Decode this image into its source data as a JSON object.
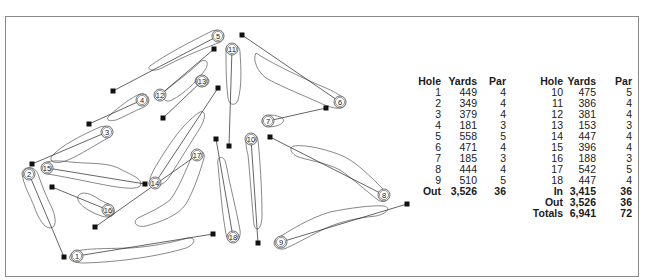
{
  "scorecard": {
    "headers": {
      "hole": "Hole",
      "yards": "Yards",
      "par": "Par"
    },
    "front_nine": [
      {
        "hole": "1",
        "yards": "449",
        "par": "4"
      },
      {
        "hole": "2",
        "yards": "349",
        "par": "4"
      },
      {
        "hole": "3",
        "yards": "379",
        "par": "4"
      },
      {
        "hole": "4",
        "yards": "181",
        "par": "3"
      },
      {
        "hole": "5",
        "yards": "558",
        "par": "5"
      },
      {
        "hole": "6",
        "yards": "471",
        "par": "4"
      },
      {
        "hole": "7",
        "yards": "185",
        "par": "3"
      },
      {
        "hole": "8",
        "yards": "444",
        "par": "4"
      },
      {
        "hole": "9",
        "yards": "510",
        "par": "5"
      }
    ],
    "front_total": {
      "label": "Out",
      "yards": "3,526",
      "par": "36"
    },
    "back_nine": [
      {
        "hole": "10",
        "yards": "475",
        "par": "5"
      },
      {
        "hole": "11",
        "yards": "386",
        "par": "4"
      },
      {
        "hole": "12",
        "yards": "381",
        "par": "4"
      },
      {
        "hole": "13",
        "yards": "153",
        "par": "3"
      },
      {
        "hole": "14",
        "yards": "447",
        "par": "4"
      },
      {
        "hole": "15",
        "yards": "396",
        "par": "4"
      },
      {
        "hole": "16",
        "yards": "188",
        "par": "3"
      },
      {
        "hole": "17",
        "yards": "542",
        "par": "5"
      },
      {
        "hole": "18",
        "yards": "447",
        "par": "4"
      }
    ],
    "back_totals": [
      {
        "label": "In",
        "yards": "3,415",
        "par": "36"
      },
      {
        "label": "Out",
        "yards": "3,526",
        "par": "36"
      },
      {
        "label": "Totals",
        "yards": "6,941",
        "par": "72"
      }
    ]
  },
  "course_map": {
    "holes": [
      {
        "number": "1",
        "green": [
          77,
          256
        ],
        "tee": [
          213,
          234
        ]
      },
      {
        "number": "2",
        "green": [
          29,
          174
        ],
        "tee": [
          64,
          257
        ]
      },
      {
        "number": "3",
        "green": [
          107,
          132
        ],
        "tee": [
          32,
          164
        ]
      },
      {
        "number": "4",
        "green": [
          142,
          100
        ],
        "tee": [
          89,
          124
        ]
      },
      {
        "number": "5",
        "green": [
          218,
          36
        ],
        "tee": [
          113,
          91
        ]
      },
      {
        "number": "6",
        "green": [
          340,
          102
        ],
        "tee": [
          242,
          35
        ]
      },
      {
        "number": "7",
        "green": [
          268,
          121
        ],
        "tee": [
          326,
          108
        ]
      },
      {
        "number": "8",
        "green": [
          384,
          195
        ],
        "tee": [
          270,
          137
        ]
      },
      {
        "number": "9",
        "green": [
          281,
          242
        ],
        "tee": [
          407,
          204
        ]
      },
      {
        "number": "10",
        "green": [
          251,
          139
        ],
        "tee": [
          258,
          243
        ]
      },
      {
        "number": "11",
        "green": [
          232,
          49
        ],
        "tee": [
          229,
          146
        ]
      },
      {
        "number": "12",
        "green": [
          160,
          95
        ],
        "tee": [
          214,
          49
        ]
      },
      {
        "number": "13",
        "green": [
          202,
          81
        ],
        "tee": [
          163,
          118
        ]
      },
      {
        "number": "14",
        "green": [
          155,
          183
        ],
        "tee": [
          218,
          88
        ]
      },
      {
        "number": "15",
        "green": [
          47,
          168
        ],
        "tee": [
          145,
          184
        ]
      },
      {
        "number": "16",
        "green": [
          108,
          210
        ],
        "tee": [
          52,
          187
        ]
      },
      {
        "number": "17",
        "green": [
          197,
          155
        ],
        "tee": [
          95,
          227
        ]
      },
      {
        "number": "18",
        "green": [
          233,
          237
        ],
        "tee": [
          216,
          139
        ]
      }
    ]
  }
}
